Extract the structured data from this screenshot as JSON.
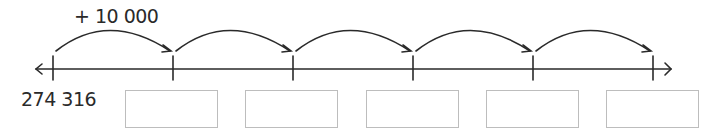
{
  "number_line": {
    "jump_label": "+ 10 000",
    "start_value": "274 316",
    "tick_count": 6,
    "jump_count": 5,
    "line_color": "#2a2a2a",
    "box_border_color": "#bdbdbd"
  },
  "answer_boxes": [
    {
      "value": ""
    },
    {
      "value": ""
    },
    {
      "value": ""
    },
    {
      "value": ""
    },
    {
      "value": ""
    }
  ]
}
